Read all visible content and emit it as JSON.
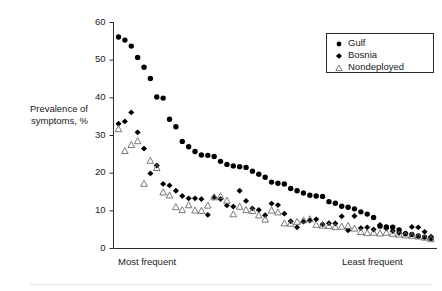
{
  "axes": {
    "y_axis_title": "Prevalence of\nsymptoms, %",
    "y_ticks": [
      "0",
      "10",
      "20",
      "30",
      "40",
      "50",
      "60"
    ],
    "x_left_label": "Most frequent",
    "x_right_label": "Least frequent"
  },
  "legend": {
    "position": "top-right",
    "entries": [
      {
        "label": "Gulf",
        "marker": "filled-circle",
        "color": "#000000"
      },
      {
        "label": "Bosnia",
        "marker": "filled-diamond",
        "color": "#000000"
      },
      {
        "label": "Nondeployed",
        "marker": "open-triangle",
        "color": "#000000"
      }
    ]
  },
  "colors": {
    "gulf": "#000000",
    "bosnia": "#000000",
    "nondeployed_stroke": "#6b6b6b",
    "axis": "#2b2b2b",
    "background": "#ffffff",
    "rule": "#e2e2e6"
  },
  "chart_data": {
    "type": "scatter",
    "title": "",
    "subtitle": "",
    "xlabel": "",
    "ylabel": "Prevalence of symptoms, %",
    "xlim": [
      0,
      51
    ],
    "ylim": [
      0,
      60
    ],
    "ytick_step": 10,
    "grid": false,
    "legend_position": "top-right",
    "x_axis_is_rank": true,
    "x_annotations": [
      "Most frequent",
      "Least frequent"
    ],
    "series": [
      {
        "name": "Gulf",
        "marker": "filled-circle",
        "values": [
          56.0,
          55.2,
          53.6,
          50.6,
          48.0,
          45.0,
          40.1,
          39.8,
          34.2,
          32.2,
          28.3,
          26.9,
          25.6,
          24.7,
          24.6,
          24.3,
          23.0,
          22.2,
          21.8,
          21.6,
          21.4,
          20.4,
          19.6,
          18.8,
          17.5,
          17.2,
          17.0,
          15.8,
          15.2,
          14.6,
          14.0,
          13.8,
          13.7,
          12.3,
          11.9,
          11.1,
          10.8,
          10.4,
          9.6,
          9.0,
          8.1,
          5.8,
          5.6,
          5.5,
          4.8,
          3.8,
          3.6,
          3.2,
          2.9,
          2.6
        ]
      },
      {
        "name": "Bosnia",
        "marker": "filled-diamond",
        "values": [
          33.0,
          33.6,
          36.0,
          30.7,
          26.4,
          19.8,
          21.9,
          17.0,
          16.6,
          15.2,
          13.8,
          13.2,
          13.2,
          13.0,
          8.8,
          13.5,
          13.0,
          11.3,
          11.0,
          15.2,
          12.5,
          10.5,
          10.1,
          8.7,
          11.8,
          11.4,
          9.1,
          7.1,
          5.5,
          7.0,
          7.3,
          7.6,
          6.3,
          6.6,
          6.5,
          8.4,
          4.7,
          8.5,
          5.3,
          5.5,
          4.9,
          6.1,
          5.2,
          4.5,
          4.0,
          3.9,
          5.6,
          5.5,
          4.3,
          3.0
        ]
      },
      {
        "name": "Nondeployed",
        "marker": "open-triangle",
        "values": [
          31.6,
          25.8,
          27.4,
          28.4,
          17.1,
          23.2,
          21.3,
          14.8,
          14.0,
          10.9,
          10.1,
          11.4,
          10.0,
          9.9,
          11.3,
          13.5,
          13.8,
          12.6,
          9.0,
          11.0,
          10.1,
          9.9,
          8.7,
          7.6,
          10.0,
          9.5,
          6.6,
          6.5,
          7.0,
          7.4,
          7.7,
          6.2,
          6.0,
          5.9,
          5.6,
          5.7,
          5.9,
          5.2,
          4.3,
          4.0,
          4.1,
          3.9,
          4.1,
          3.8,
          3.6,
          3.4,
          3.3,
          3.1,
          2.8,
          2.4
        ]
      }
    ]
  }
}
